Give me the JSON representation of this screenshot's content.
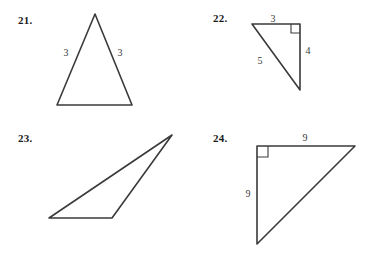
{
  "page": {
    "background_color": "#ffffff",
    "ink_color": "#3a3a3a"
  },
  "problems": [
    {
      "number": "21.",
      "shape": "isosceles-triangle",
      "labels": [
        {
          "text": "3",
          "side": "left"
        },
        {
          "text": "3",
          "side": "right"
        }
      ],
      "right_angle_marked": false
    },
    {
      "number": "22.",
      "shape": "right-triangle",
      "labels": [
        {
          "text": "3",
          "side": "top"
        },
        {
          "text": "4",
          "side": "right"
        },
        {
          "text": "5",
          "side": "hypotenuse"
        }
      ],
      "right_angle_marked": true
    },
    {
      "number": "23.",
      "shape": "scalene-triangle",
      "labels": [],
      "right_angle_marked": false
    },
    {
      "number": "24.",
      "shape": "right-triangle",
      "labels": [
        {
          "text": "9",
          "side": "top"
        },
        {
          "text": "9",
          "side": "left"
        }
      ],
      "right_angle_marked": true
    }
  ]
}
